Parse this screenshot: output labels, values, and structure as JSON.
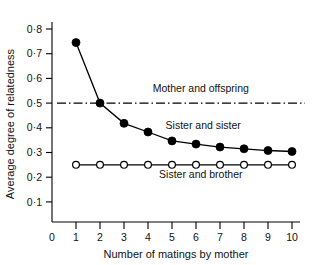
{
  "chart_data": {
    "type": "line",
    "title": "",
    "xlabel": "Number of matings by mother",
    "ylabel": "Average degree of relatedness",
    "xlim": [
      0,
      10.6
    ],
    "ylim": [
      0,
      0.84
    ],
    "grid": false,
    "legend_position": "inline-annotations",
    "x": [
      1,
      2,
      3,
      4,
      5,
      6,
      7,
      8,
      9,
      10
    ],
    "xticks": [
      0,
      1,
      2,
      3,
      4,
      5,
      6,
      7,
      8,
      9,
      10
    ],
    "xticklabels": [
      "0",
      "1",
      "2",
      "3",
      "4",
      "5",
      "6",
      "7",
      "8",
      "9",
      "10"
    ],
    "yticks": [
      0.1,
      0.2,
      0.3,
      0.4,
      0.5,
      0.6,
      0.7,
      0.8
    ],
    "yticklabels": [
      "0·1",
      "0·2",
      "0·3",
      "0·4",
      "0·5",
      "0·6",
      "0·7",
      "0·8"
    ],
    "series": [
      {
        "name": "Sister and sister",
        "marker": "filled-circle",
        "linestyle": "solid",
        "color": "#000000",
        "values": [
          0.745,
          0.5,
          0.418,
          0.383,
          0.347,
          0.334,
          0.322,
          0.315,
          0.308,
          0.304
        ]
      },
      {
        "name": "Sister and brother",
        "marker": "open-circle",
        "linestyle": "solid",
        "color": "#000000",
        "values": [
          0.25,
          0.25,
          0.25,
          0.25,
          0.25,
          0.25,
          0.25,
          0.25,
          0.25,
          0.25
        ]
      }
    ],
    "reference_lines": [
      {
        "name": "Mother and offspring",
        "value": 0.5,
        "linestyle": "dash-dot",
        "color": "#000000",
        "orientation": "horizontal"
      }
    ],
    "annotations": [
      {
        "text": "Mother and offspring",
        "x": 6.2,
        "y": 0.545
      },
      {
        "text": "Sister and sister",
        "x": 6.3,
        "y": 0.395
      },
      {
        "text": "Sister and brother",
        "x": 6.2,
        "y": 0.195
      }
    ]
  },
  "axes": {
    "ylabel_text": "Average degree of relatedness",
    "xlabel_text": "Number of matings by mother"
  },
  "ytick_labels": [
    "0·8",
    "0·7",
    "0·6",
    "0·5",
    "0·4",
    "0·3",
    "0·2",
    "0·1"
  ],
  "xtick_labels": [
    "0",
    "1",
    "2",
    "3",
    "4",
    "5",
    "6",
    "7",
    "8",
    "9",
    "10"
  ],
  "annotation_labels": {
    "mother_offspring": "Mother and offspring",
    "sister_sister": "Sister and sister",
    "sister_brother": "Sister and brother"
  },
  "colors": {
    "ink": "#000000",
    "background": "#ffffff"
  }
}
